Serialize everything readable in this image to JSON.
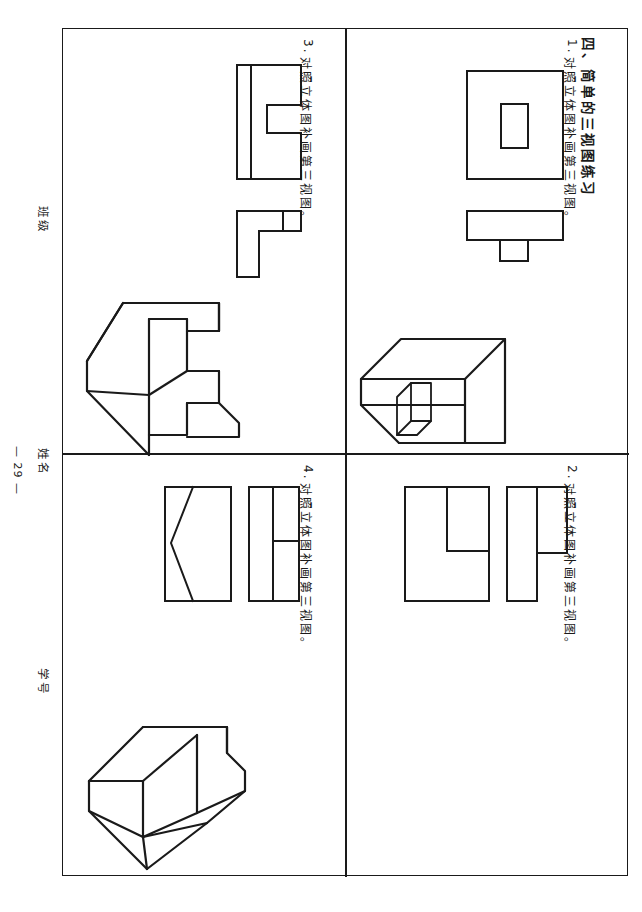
{
  "document": {
    "section_heading": "四、简单的三视图练习",
    "page_number": "— 29 —"
  },
  "margin": {
    "class_label": "班级",
    "name_label": "姓名",
    "student_id_label": "学号"
  },
  "exercises": [
    {
      "number": "1.",
      "prompt": "对照立体图补画第三视图。",
      "views": "front-view-with-rectangular-hole and top-view-with-tab",
      "solid": "none-shown"
    },
    {
      "number": "2.",
      "prompt": "对照立体图补画第三视图。",
      "views": "front-view-L-shape and side-view-stepped",
      "solid": "rectangular-block-with-rectangular-slot"
    },
    {
      "number": "3.",
      "prompt": "对照立体图补画第三视图。",
      "views": "front-view-C-shape and top-view-L-shape",
      "solid": "C-shaped-bracket-block"
    },
    {
      "number": "4.",
      "prompt": "对照立体图补画第三视图。",
      "views": "front-view-V-notch and side-view-divided-rectangle",
      "solid": "wedge-block-with-inclined-face"
    }
  ]
}
